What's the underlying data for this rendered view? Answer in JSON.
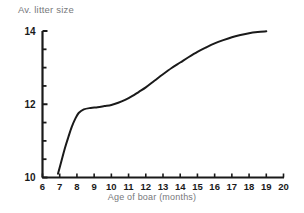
{
  "chart_data": {
    "type": "line",
    "title": "",
    "xlabel": "Age of boar (months)",
    "ylabel": "Av. litter size",
    "xlim": [
      6,
      20
    ],
    "ylim": [
      10,
      14
    ],
    "grid": false,
    "legend": null,
    "x_ticks": [
      6,
      7,
      8,
      9,
      10,
      11,
      12,
      13,
      14,
      15,
      16,
      17,
      18,
      19,
      20
    ],
    "x_tick_labels": [
      "6",
      "7",
      "8",
      "9",
      "10",
      "11",
      "12",
      "13",
      "14",
      "15",
      "16",
      "17",
      "18",
      "19",
      "20"
    ],
    "y_ticks": [
      10,
      12,
      14
    ],
    "y_tick_labels": [
      "10",
      "12",
      "14"
    ],
    "y_minor_tick_step": 0.5,
    "line_color": "#1a1a1a",
    "line_width": 2,
    "x": [
      6.9,
      7.1,
      7.3,
      7.5,
      7.7,
      7.9,
      8.1,
      8.4,
      8.8,
      9.2,
      9.6,
      10.0,
      10.4,
      10.8,
      11.2,
      11.6,
      12.0,
      12.5,
      13.0,
      13.5,
      14.0,
      14.5,
      15.0,
      15.5,
      16.0,
      16.5,
      17.0,
      17.5,
      18.0,
      18.5,
      19.0
    ],
    "y": [
      10.1,
      10.45,
      10.8,
      11.1,
      11.38,
      11.6,
      11.76,
      11.86,
      11.9,
      11.92,
      11.95,
      11.98,
      12.04,
      12.12,
      12.22,
      12.34,
      12.46,
      12.64,
      12.82,
      12.99,
      13.14,
      13.29,
      13.43,
      13.55,
      13.66,
      13.75,
      13.83,
      13.89,
      13.94,
      13.97,
      13.99
    ],
    "series_name": "Average litter size vs age of boar"
  },
  "labels": {
    "y_axis_title": "Av. litter size",
    "x_axis_title": "Age of boar (months)"
  }
}
